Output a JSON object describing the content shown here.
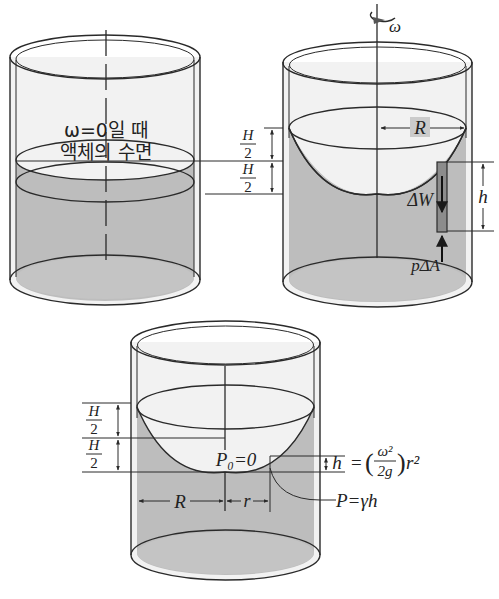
{
  "figure": {
    "colors": {
      "liquid": "#bdbdbd",
      "liquid_dark": "#a8a8a8",
      "glass": "#ececec",
      "bottom_rim": "#f4f4f4",
      "line": "#2a2a2a",
      "element": "#8c8c8c"
    },
    "left_cylinder": {
      "label_line1": "ω=0일 때",
      "label_line2": "액체의 수면"
    },
    "right_cylinder": {
      "rotation_label": "ω",
      "radius_label": "R",
      "upper_half_num": "H",
      "upper_half_den": "2",
      "lower_half_num": "H",
      "lower_half_den": "2",
      "weight_label": "ΔW",
      "height_label": "h",
      "pressure_force_label": "pΔA"
    },
    "bottom_cylinder": {
      "upper_half_num": "H",
      "upper_half_den": "2",
      "lower_half_num": "H",
      "lower_half_den": "2",
      "vertex_pressure_label": "P₀=0",
      "radius_label": "R",
      "r_label": "r",
      "h_label": "h",
      "h_formula_eq": "=",
      "h_formula_num": "ω²",
      "h_formula_den": "2g",
      "h_formula_tail": "r²",
      "pressure_label": "P=γh"
    }
  }
}
